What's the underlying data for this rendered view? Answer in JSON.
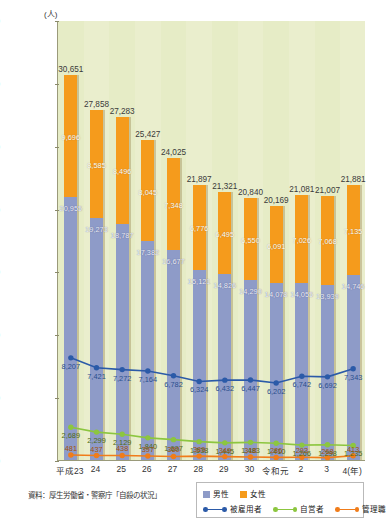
{
  "unit_label": "(人)",
  "source_note": "資料：厚生労働省・警察庁「自殺の状況」",
  "legend": {
    "bar_male": "男性",
    "bar_female": "女性",
    "line_employed": "被雇用者",
    "line_self": "自営者",
    "line_manager": "管理職"
  },
  "colors": {
    "male": "#8e9bc8",
    "female": "#f59b1c",
    "employed": "#2b5aa8",
    "self_employed": "#8cc63f",
    "manager": "#f07c1a",
    "plot_bg": "#eaeecd",
    "band": "#e6ecc6"
  },
  "chart_data": {
    "type": "bar",
    "title": "",
    "xlabel": "(年)",
    "ylabel": "(人)",
    "ylim": [
      0,
      35000
    ],
    "yticks": [
      "0",
      "5,000",
      "10,000",
      "15,000",
      "20,000",
      "25,000",
      "30,000",
      "35,000"
    ],
    "ytick_values": [
      0,
      5000,
      10000,
      15000,
      20000,
      25000,
      30000,
      35000
    ],
    "grid": false,
    "legend_position": "bottom-right",
    "categories": [
      "平成23",
      "24",
      "25",
      "26",
      "27",
      "28",
      "29",
      "30",
      "令和元",
      "2",
      "3",
      "4(年)"
    ],
    "totals": [
      30651,
      27858,
      27283,
      25427,
      24025,
      21897,
      21321,
      20840,
      20169,
      21081,
      21007,
      21881
    ],
    "total_labels": [
      "30,651",
      "27,858",
      "27,283",
      "25,427",
      "24,025",
      "21,897",
      "21,321",
      "20,840",
      "20,169",
      "21,081",
      "21,007",
      "21,881"
    ],
    "series": [
      {
        "name": "女性",
        "kind": "bar-segment",
        "values": [
          9696,
          8585,
          8496,
          8045,
          7348,
          6776,
          6495,
          6550,
          6091,
          7026,
          7068,
          7135
        ],
        "labels": [
          "9,696",
          "8,585",
          "8,496",
          "8,045",
          "7,348",
          "6,776",
          "6,495",
          "6,550",
          "6,091",
          "7,026",
          "7,068",
          "7,135"
        ]
      },
      {
        "name": "男性",
        "kind": "bar-segment",
        "values": [
          20955,
          19273,
          18787,
          17382,
          16677,
          15121,
          14826,
          14290,
          14078,
          14055,
          13939,
          14746
        ],
        "labels": [
          "20,955",
          "19,273",
          "18,787",
          "17,382",
          "16,677",
          "15,121",
          "14,826",
          "14,290",
          "14,078",
          "14,055",
          "13,939",
          "14,746"
        ]
      },
      {
        "name": "被雇用者",
        "kind": "line",
        "values": [
          8207,
          7421,
          7272,
          7164,
          6782,
          6324,
          6432,
          6447,
          6202,
          6742,
          6692,
          7343
        ],
        "labels": [
          "8,207",
          "7,421",
          "7,272",
          "7,164",
          "6,782",
          "6,324",
          "6,432",
          "6,447",
          "6,202",
          "6,742",
          "6,692",
          "7,343"
        ]
      },
      {
        "name": "自営者",
        "kind": "line",
        "values": [
          2689,
          2299,
          2129,
          1840,
          1697,
          1538,
          1445,
          1483,
          1410,
          1266,
          1298,
          1235
        ],
        "labels": [
          "2,689",
          "2,299",
          "2,129",
          "1,840",
          "1,697",
          "1,538",
          "1,445",
          "1,483",
          "1,410",
          "1,266",
          "1,298",
          "1,235"
        ]
      },
      {
        "name": "管理職",
        "kind": "line",
        "values": [
          481,
          437,
          438,
          397,
          360,
          389,
          349,
          318,
          286,
          293,
          268,
          413
        ],
        "labels": [
          "481",
          "437",
          "438",
          "397",
          "360",
          "389",
          "349",
          "318",
          "286",
          "293",
          "268",
          "413"
        ]
      }
    ]
  }
}
